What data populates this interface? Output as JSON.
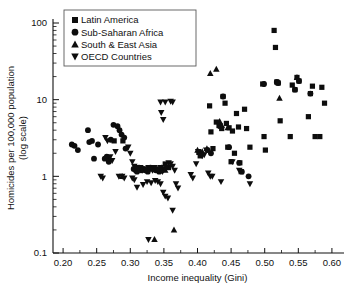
{
  "figure": {
    "background": "#ffffff",
    "marker_color": "#0d0d0d",
    "axis_color": "#111111"
  },
  "axes": {
    "x": {
      "label": "Income inequality (Gini)",
      "ticks": [
        "0.20",
        "0.25",
        "0.30",
        "0.35",
        "0.40",
        "0.45",
        "0.50",
        "0.55",
        "0.60"
      ],
      "tick_values": [
        0.2,
        0.25,
        0.3,
        0.35,
        0.4,
        0.45,
        0.5,
        0.55,
        0.6
      ],
      "range": [
        0.185,
        0.615
      ]
    },
    "y": {
      "label_line1": "Homicides per 100,000 population",
      "label_line2": "(log scale)",
      "ticks": [
        "100",
        "10",
        "1",
        "0.1"
      ],
      "tick_values": [
        100,
        10,
        1,
        0.1
      ],
      "scale": "log",
      "range": [
        0.1,
        100
      ]
    }
  },
  "legend": {
    "position": "top-left",
    "items": [
      {
        "label": "Latin America",
        "marker": "square",
        "marker_icon": "square-marker-icon"
      },
      {
        "label": "Sub-Saharan Africa",
        "marker": "circle",
        "marker_icon": "circle-marker-icon"
      },
      {
        "label": "South & East Asia",
        "marker": "triangle-up",
        "marker_icon": "triangle-up-marker-icon"
      },
      {
        "label": "OECD Countries",
        "marker": "triangle-down",
        "marker_icon": "triangle-down-marker-icon"
      }
    ]
  },
  "chart_data": {
    "type": "scatter",
    "title": "",
    "xlabel": "Income inequality (Gini)",
    "ylabel": "Homicides per 100,000 population (log scale)",
    "xlim": [
      0.185,
      0.615
    ],
    "ylim": [
      0.1,
      100
    ],
    "yscale": "log",
    "grid": false,
    "legend_position": "top-left",
    "series": [
      {
        "name": "Latin America",
        "marker": "square",
        "points": [
          [
            0.352,
            1.45
          ],
          [
            0.357,
            1.3
          ],
          [
            0.402,
            2.05
          ],
          [
            0.404,
            1.85
          ],
          [
            0.418,
            8.3
          ],
          [
            0.42,
            3.8
          ],
          [
            0.423,
            2.3
          ],
          [
            0.428,
            5.1
          ],
          [
            0.432,
            4.6
          ],
          [
            0.434,
            4.5
          ],
          [
            0.436,
            4.2
          ],
          [
            0.438,
            11.0
          ],
          [
            0.441,
            9.0
          ],
          [
            0.443,
            4.9
          ],
          [
            0.445,
            2.4
          ],
          [
            0.447,
            4.3
          ],
          [
            0.45,
            1.55
          ],
          [
            0.452,
            3.9
          ],
          [
            0.455,
            2.0
          ],
          [
            0.458,
            6.6
          ],
          [
            0.461,
            4.4
          ],
          [
            0.463,
            1.5
          ],
          [
            0.465,
            1.15
          ],
          [
            0.47,
            7.5
          ],
          [
            0.473,
            4.2
          ],
          [
            0.478,
            2.4
          ],
          [
            0.497,
            16.0
          ],
          [
            0.499,
            3.3
          ],
          [
            0.501,
            2.2
          ],
          [
            0.514,
            80.0
          ],
          [
            0.516,
            48.0
          ],
          [
            0.518,
            17.0
          ],
          [
            0.52,
            16.5
          ],
          [
            0.523,
            5.3
          ],
          [
            0.538,
            3.3
          ],
          [
            0.541,
            15.5
          ],
          [
            0.545,
            13.5
          ],
          [
            0.548,
            19.5
          ],
          [
            0.551,
            17.5
          ],
          [
            0.565,
            6.0
          ],
          [
            0.568,
            12.0
          ],
          [
            0.571,
            15.0
          ],
          [
            0.575,
            3.3
          ],
          [
            0.582,
            3.3
          ],
          [
            0.585,
            14.5
          ],
          [
            0.589,
            9.0
          ],
          [
            0.276,
            2.9
          ],
          [
            0.289,
            2.9
          ]
        ]
      },
      {
        "name": "Sub-Saharan Africa",
        "marker": "circle",
        "points": [
          [
            0.213,
            2.6
          ],
          [
            0.217,
            2.5
          ],
          [
            0.222,
            2.2
          ],
          [
            0.237,
            4.0
          ],
          [
            0.239,
            2.8
          ],
          [
            0.243,
            2.9
          ],
          [
            0.246,
            1.7
          ],
          [
            0.252,
            2.6
          ],
          [
            0.262,
            1.7
          ],
          [
            0.265,
            1.8
          ],
          [
            0.268,
            1.55
          ],
          [
            0.271,
            3.0
          ],
          [
            0.275,
            4.7
          ],
          [
            0.281,
            4.5
          ],
          [
            0.284,
            4.0
          ],
          [
            0.287,
            3.5
          ],
          [
            0.291,
            3.2
          ],
          [
            0.293,
            2.3
          ],
          [
            0.305,
            1.25
          ],
          [
            0.308,
            1.2
          ],
          [
            0.31,
            1.15
          ],
          [
            0.313,
            1.3
          ],
          [
            0.316,
            1.2
          ],
          [
            0.319,
            1.25
          ],
          [
            0.322,
            1.2
          ],
          [
            0.326,
            1.15
          ],
          [
            0.33,
            1.3
          ],
          [
            0.334,
            1.25
          ],
          [
            0.338,
            1.2
          ],
          [
            0.343,
            1.15
          ],
          [
            0.347,
            1.2
          ],
          [
            0.415,
            2.2
          ],
          [
            0.42,
            2.0
          ],
          [
            0.438,
            11.0
          ],
          [
            0.447,
            2.4
          ],
          [
            0.462,
            1.5
          ],
          [
            0.466,
            1.15
          ],
          [
            0.476,
            1.0
          ],
          [
            0.499,
            16.0
          ],
          [
            0.518,
            17.0
          ],
          [
            0.52,
            16.5
          ],
          [
            0.545,
            13.5
          ],
          [
            0.551,
            17.5
          ],
          [
            0.568,
            12.0
          ]
        ]
      },
      {
        "name": "South & East Asia",
        "marker": "triangle-up",
        "points": [
          [
            0.419,
            22.0
          ],
          [
            0.428,
            25.0
          ],
          [
            0.407,
            2.1
          ],
          [
            0.433,
            5.2
          ],
          [
            0.436,
            4.6
          ],
          [
            0.414,
            2.3
          ],
          [
            0.4,
            2.2
          ],
          [
            0.336,
            0.15
          ],
          [
            0.365,
            0.2
          ],
          [
            0.347,
            1.3
          ],
          [
            0.352,
            1.2
          ],
          [
            0.445,
            4.3
          ],
          [
            0.522,
            10.5
          ],
          [
            0.548,
            19.5
          ],
          [
            0.27,
            1.7
          ],
          [
            0.288,
            1.0
          ]
        ]
      },
      {
        "name": "OECD Countries",
        "marker": "triangle-down",
        "points": [
          [
            0.345,
            9.3
          ],
          [
            0.352,
            9.3
          ],
          [
            0.36,
            9.5
          ],
          [
            0.363,
            9.3
          ],
          [
            0.346,
            6.8
          ],
          [
            0.349,
            5.5
          ],
          [
            0.263,
            3.2
          ],
          [
            0.266,
            2.9
          ],
          [
            0.27,
            1.8
          ],
          [
            0.273,
            1.6
          ],
          [
            0.278,
            2.1
          ],
          [
            0.283,
            1.0
          ],
          [
            0.288,
            1.0
          ],
          [
            0.291,
            0.95
          ],
          [
            0.256,
            1.0
          ],
          [
            0.259,
            0.95
          ],
          [
            0.297,
            2.4
          ],
          [
            0.3,
            2.0
          ],
          [
            0.303,
            1.55
          ],
          [
            0.306,
            1.35
          ],
          [
            0.309,
            1.3
          ],
          [
            0.312,
            1.25
          ],
          [
            0.315,
            1.3
          ],
          [
            0.318,
            1.2
          ],
          [
            0.321,
            1.25
          ],
          [
            0.324,
            1.2
          ],
          [
            0.327,
            1.3
          ],
          [
            0.33,
            1.25
          ],
          [
            0.333,
            1.2
          ],
          [
            0.336,
            1.3
          ],
          [
            0.339,
            1.25
          ],
          [
            0.342,
            1.2
          ],
          [
            0.345,
            1.3
          ],
          [
            0.348,
            1.15
          ],
          [
            0.351,
            1.25
          ],
          [
            0.354,
            1.3
          ],
          [
            0.357,
            1.5
          ],
          [
            0.36,
            1.45
          ],
          [
            0.363,
            1.35
          ],
          [
            0.366,
            1.2
          ],
          [
            0.303,
            0.95
          ],
          [
            0.306,
            0.9
          ],
          [
            0.31,
            0.72
          ],
          [
            0.319,
            0.78
          ],
          [
            0.325,
            0.85
          ],
          [
            0.331,
            0.82
          ],
          [
            0.337,
            0.88
          ],
          [
            0.341,
            0.85
          ],
          [
            0.345,
            0.8
          ],
          [
            0.349,
            0.62
          ],
          [
            0.352,
            0.55
          ],
          [
            0.356,
            0.52
          ],
          [
            0.363,
            0.36
          ],
          [
            0.368,
            0.8
          ],
          [
            0.371,
            0.7
          ],
          [
            0.39,
            1.05
          ],
          [
            0.393,
            0.95
          ],
          [
            0.398,
            1.45
          ],
          [
            0.401,
            2.1
          ],
          [
            0.404,
            1.9
          ],
          [
            0.407,
            1.85
          ],
          [
            0.41,
            1.9
          ],
          [
            0.413,
            2.2
          ],
          [
            0.416,
            1.1
          ],
          [
            0.419,
            1.0
          ],
          [
            0.422,
            1.0
          ],
          [
            0.435,
            0.85
          ],
          [
            0.452,
            1.55
          ],
          [
            0.462,
            1.2
          ],
          [
            0.478,
            0.8
          ],
          [
            0.327,
            0.15
          ]
        ]
      }
    ]
  }
}
